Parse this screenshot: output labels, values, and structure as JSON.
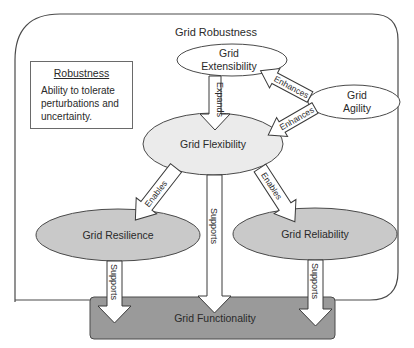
{
  "diagram": {
    "outer_title": "Grid Robustness",
    "note": {
      "title": "Robustness",
      "body": "Ability to tolerate perturbations and uncertainty."
    },
    "nodes": {
      "extensibility": {
        "line1": "Grid",
        "line2": "Extensibility",
        "fill": "#ffffff"
      },
      "agility": {
        "line1": "Grid",
        "line2": "Agility",
        "fill": "#ffffff"
      },
      "flexibility": {
        "label": "Grid Flexibility",
        "fill": "#ebebeb"
      },
      "resilience": {
        "label": "Grid Resilience",
        "fill": "#c9c9c9"
      },
      "reliability": {
        "label": "Grid Reliability",
        "fill": "#c9c9c9"
      },
      "functionality": {
        "label": "Grid Functionality",
        "fill": "#9a9a9a"
      }
    },
    "edges": [
      {
        "from": "Grid Agility",
        "to": "Grid Extensibility",
        "label": "Enhances"
      },
      {
        "from": "Grid Agility",
        "to": "Grid Flexibility",
        "label": "Enhances"
      },
      {
        "from": "Grid Extensibility",
        "to": "Grid Flexibility",
        "label": "Expands"
      },
      {
        "from": "Grid Flexibility",
        "to": "Grid Resilience",
        "label": "Enables"
      },
      {
        "from": "Grid Flexibility",
        "to": "Grid Reliability",
        "label": "Enables"
      },
      {
        "from": "Grid Flexibility",
        "to": "Grid Functionality",
        "label": "Supports"
      },
      {
        "from": "Grid Resilience",
        "to": "Grid Functionality",
        "label": "Supports"
      },
      {
        "from": "Grid Reliability",
        "to": "Grid Functionality",
        "label": "Supports"
      }
    ]
  }
}
